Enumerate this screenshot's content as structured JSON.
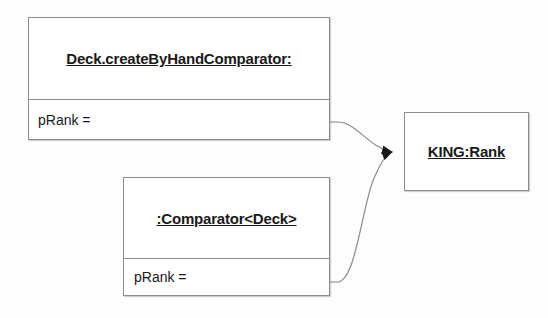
{
  "diagram": {
    "type": "uml-object-diagram",
    "background_color": "#fdfdfd",
    "border_color": "#8c8c8c",
    "text_color": "#1a1a1a",
    "boxes": [
      {
        "id": "deck-comparator",
        "title": "Deck.createByHandComparator:",
        "attribute": "pRank ="
      },
      {
        "id": "comparator-deck",
        "title": ":Comparator<Deck>",
        "attribute": "pRank ="
      },
      {
        "id": "king-rank",
        "title": "KING:Rank"
      }
    ],
    "connectors": [
      {
        "id": "deck-comparator-to-king-rank",
        "from": "deck-comparator.pRank",
        "to": "king-rank",
        "style": "curved-arrow",
        "arrowhead": "filled-triangle"
      },
      {
        "id": "comparator-deck-to-king-rank",
        "from": "comparator-deck.pRank",
        "to": "king-rank",
        "style": "curved-arrow",
        "arrowhead": "filled-triangle"
      }
    ]
  }
}
